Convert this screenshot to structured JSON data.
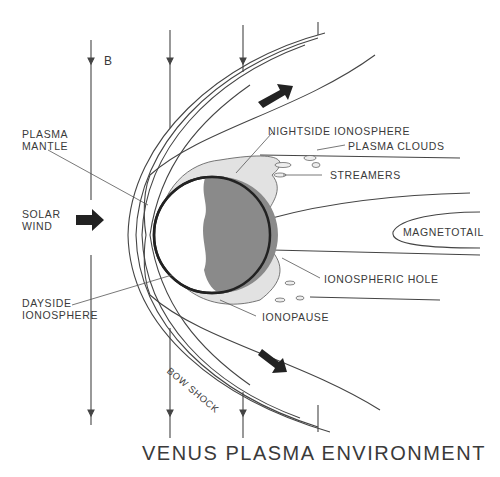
{
  "title": "VENUS PLASMA ENVIRONMENT",
  "labels": {
    "b_field": "B",
    "plasma_mantle": [
      "PLASMA",
      "MANTLE"
    ],
    "solar_wind": [
      "SOLAR",
      "WIND"
    ],
    "dayside_ionosphere": [
      "DAYSIDE",
      "IONOSPHERE"
    ],
    "bow_shock": "BOW SHOCK",
    "nightside_ionosphere": "NIGHTSIDE IONOSPHERE",
    "plasma_clouds": "PLASMA CLOUDS",
    "streamers": "STREAMERS",
    "magnetotail": "MAGNETOTAIL",
    "ionospheric_hole": "IONOSPHERIC HOLE",
    "ionopause": "IONOPAUSE"
  },
  "colors": {
    "line": "#444444",
    "ionosphere_fill": "#e2e2e2",
    "nightside_fill": "#8a8a8a",
    "arrow_fill": "#222222"
  }
}
